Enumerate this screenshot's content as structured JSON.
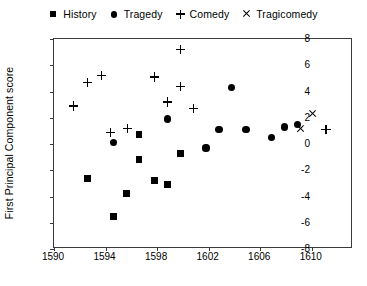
{
  "chart_data": {
    "type": "scatter",
    "title": "",
    "xlabel": "",
    "ylabel": "First Principal Component score",
    "xlim": [
      1590,
      1613.2
    ],
    "ylim": [
      -8,
      8
    ],
    "xticks": [
      1590,
      1594,
      1598,
      1602,
      1606,
      1610
    ],
    "yticks": [
      -8,
      -6,
      -4,
      -2,
      0,
      2,
      4,
      6,
      8
    ],
    "grid": false,
    "legend_position": "top-center",
    "series": [
      {
        "name": "History",
        "marker": "square",
        "color": "#000000",
        "points": [
          {
            "x": 1592.6,
            "y": -2.6
          },
          {
            "x": 1594.6,
            "y": -5.5
          },
          {
            "x": 1595.6,
            "y": -3.8
          },
          {
            "x": 1596.6,
            "y": 0.7
          },
          {
            "x": 1596.6,
            "y": -1.2
          },
          {
            "x": 1597.8,
            "y": -2.8
          },
          {
            "x": 1598.8,
            "y": -3.1
          },
          {
            "x": 1599.8,
            "y": -0.7
          }
        ]
      },
      {
        "name": "Tragedy",
        "marker": "circle",
        "color": "#000000",
        "points": [
          {
            "x": 1594.6,
            "y": 0.1
          },
          {
            "x": 1598.8,
            "y": 1.9
          },
          {
            "x": 1601.8,
            "y": -0.3
          },
          {
            "x": 1603.8,
            "y": 4.3
          },
          {
            "x": 1602.8,
            "y": 1.1
          },
          {
            "x": 1604.9,
            "y": 1.1
          },
          {
            "x": 1606.9,
            "y": 0.5
          },
          {
            "x": 1607.9,
            "y": 1.3
          },
          {
            "x": 1608.9,
            "y": 1.5
          }
        ]
      },
      {
        "name": "Comedy",
        "marker": "plus",
        "color": "#000000",
        "points": [
          {
            "x": 1591.5,
            "y": 2.9
          },
          {
            "x": 1592.6,
            "y": 4.7
          },
          {
            "x": 1593.7,
            "y": 5.2
          },
          {
            "x": 1594.4,
            "y": 0.9
          },
          {
            "x": 1595.7,
            "y": 1.2
          },
          {
            "x": 1597.8,
            "y": 5.1
          },
          {
            "x": 1599.8,
            "y": 7.2
          },
          {
            "x": 1599.8,
            "y": 4.4
          },
          {
            "x": 1598.8,
            "y": 3.2
          },
          {
            "x": 1600.8,
            "y": 2.7
          },
          {
            "x": 1611.1,
            "y": 1.1
          }
        ]
      },
      {
        "name": "Tragicomedy",
        "marker": "cross",
        "color": "#000000",
        "points": [
          {
            "x": 1610.1,
            "y": 2.3
          },
          {
            "x": 1609.1,
            "y": 1.2
          }
        ]
      }
    ]
  }
}
